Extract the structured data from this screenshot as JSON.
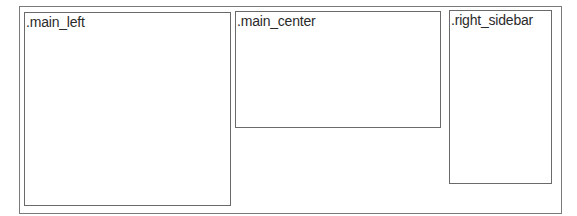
{
  "diagram": {
    "container": {
      "name": "page-container"
    },
    "regions": [
      {
        "key": "main_left",
        "label": ".main_left"
      },
      {
        "key": "main_center",
        "label": ".main_center"
      },
      {
        "key": "right_sidebar",
        "label": ".right_sidebar"
      }
    ]
  }
}
